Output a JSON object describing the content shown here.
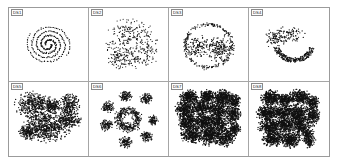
{
  "figure": {
    "title": "",
    "layout": {
      "rows": 2,
      "cols": 4
    },
    "point_color": "#111111",
    "panel_background": "#ffffff",
    "border_color": "#9b9b9b"
  },
  "panels": [
    {
      "label": "DS1",
      "description": "two-arm spiral",
      "shape": "spiral",
      "clusters": 2,
      "density": "thin-line"
    },
    {
      "label": "DS2",
      "description": "sparse crescent and blob clusters",
      "shape": "crescents",
      "clusters": 4,
      "density": "sparse"
    },
    {
      "label": "DS3",
      "description": "outer ring enclosing two dense blobs",
      "shape": "ring-with-cores",
      "clusters": 3,
      "density": "medium"
    },
    {
      "label": "DS4",
      "description": "thick lower arc with scattered upper clusters",
      "shape": "arc",
      "clusters": 3,
      "density": "medium"
    },
    {
      "label": "DS5",
      "description": "blobs of varying size including a dumbbell",
      "shape": "blobs",
      "clusters": 6,
      "density": "dense"
    },
    {
      "label": "DS6",
      "description": "central annulus cluster with satellite blobs",
      "shape": "annulus-satellites",
      "clusters": 8,
      "density": "dense"
    },
    {
      "label": "DS7",
      "description": "many overlapping irregular dense clusters",
      "shape": "irregular",
      "clusters": 15,
      "density": "very-dense"
    },
    {
      "label": "DS8",
      "description": "many overlapping irregular clusters with a tail",
      "shape": "irregular",
      "clusters": 14,
      "density": "very-dense"
    }
  ],
  "chart_data": {
    "type": "scatter",
    "title": "",
    "xlabel": "",
    "ylabel": "",
    "grid": false,
    "legend": false,
    "axis_ticks": false,
    "panels": [
      {
        "name": "DS1",
        "generator": "spiral",
        "params": {
          "arms": 2,
          "turns": 2.1,
          "points_per_arm": 150,
          "noise": 0.6,
          "r_max": 30
        },
        "xlim": [
          0,
          100
        ],
        "ylim": [
          0,
          100
        ]
      },
      {
        "name": "DS2",
        "generator": "gaussian_clusters",
        "params": {
          "noise": 3.2,
          "marker_size": 0.75
        },
        "clusters": [
          {
            "cx": 52,
            "cy": 34,
            "rx": 17,
            "ry": 15,
            "n": 180
          },
          {
            "cx": 30,
            "cy": 62,
            "rx": 9,
            "ry": 14,
            "n": 70
          },
          {
            "cx": 50,
            "cy": 74,
            "rx": 16,
            "ry": 9,
            "n": 120
          },
          {
            "cx": 80,
            "cy": 56,
            "rx": 8,
            "ry": 16,
            "n": 80
          }
        ],
        "xlim": [
          0,
          100
        ],
        "ylim": [
          0,
          100
        ]
      },
      {
        "name": "DS3",
        "generator": "ring_plus_blobs",
        "params": {
          "ring_cx": 50,
          "ring_cy": 52,
          "ring_r": 36,
          "ring_n": 220,
          "ring_noise": 1.6
        },
        "clusters": [
          {
            "cx": 34,
            "cy": 54,
            "rx": 11,
            "ry": 10,
            "n": 130
          },
          {
            "cx": 66,
            "cy": 56,
            "rx": 12,
            "ry": 12,
            "n": 190
          }
        ],
        "xlim": [
          0,
          100
        ],
        "ylim": [
          0,
          100
        ]
      },
      {
        "name": "DS4",
        "generator": "arc_plus_blobs",
        "params": {
          "arc_cx": 58,
          "arc_cy": 48,
          "arc_r": 28,
          "arc_start_deg": 15,
          "arc_end_deg": 165,
          "arc_n": 260,
          "arc_thickness": 4
        },
        "clusters": [
          {
            "cx": 30,
            "cy": 40,
            "rx": 8,
            "ry": 9,
            "n": 90
          },
          {
            "cx": 50,
            "cy": 33,
            "rx": 12,
            "ry": 7,
            "n": 90
          }
        ],
        "xlim": [
          0,
          100
        ],
        "ylim": [
          0,
          100
        ]
      },
      {
        "name": "DS5",
        "generator": "gaussian_clusters",
        "params": {
          "noise": 1.1,
          "marker_size": 0.85
        },
        "clusters": [
          {
            "cx": 28,
            "cy": 28,
            "rx": 15,
            "ry": 12,
            "n": 420
          },
          {
            "cx": 57,
            "cy": 28,
            "rx": 7,
            "ry": 6,
            "n": 150
          },
          {
            "cx": 82,
            "cy": 26,
            "rx": 8,
            "ry": 10,
            "n": 220
          },
          {
            "cx": 82,
            "cy": 52,
            "rx": 9,
            "ry": 9,
            "n": 230
          },
          {
            "cx": 47,
            "cy": 62,
            "rx": 19,
            "ry": 13,
            "n": 620
          },
          {
            "cx": 18,
            "cy": 72,
            "rx": 7,
            "ry": 6,
            "n": 150
          }
        ],
        "xlim": [
          0,
          100
        ],
        "ylim": [
          0,
          100
        ]
      },
      {
        "name": "DS6",
        "generator": "annulus_plus_satellites",
        "params": {
          "ring_cx": 50,
          "ring_cy": 50,
          "ring_r": 15,
          "ring_n": 420,
          "ring_noise": 3.2
        },
        "clusters": [
          {
            "cx": 45,
            "cy": 13,
            "rx": 5,
            "ry": 5,
            "n": 110
          },
          {
            "cx": 78,
            "cy": 16,
            "rx": 5,
            "ry": 5,
            "n": 110
          },
          {
            "cx": 18,
            "cy": 30,
            "rx": 5,
            "ry": 5,
            "n": 110
          },
          {
            "cx": 88,
            "cy": 52,
            "rx": 4,
            "ry": 4,
            "n": 90
          },
          {
            "cx": 16,
            "cy": 60,
            "rx": 5,
            "ry": 5,
            "n": 110
          },
          {
            "cx": 78,
            "cy": 78,
            "rx": 5,
            "ry": 5,
            "n": 110
          },
          {
            "cx": 45,
            "cy": 88,
            "rx": 5,
            "ry": 5,
            "n": 110
          }
        ],
        "xlim": [
          0,
          100
        ],
        "ylim": [
          0,
          100
        ]
      },
      {
        "name": "DS7",
        "generator": "gaussian_clusters",
        "params": {
          "noise": 1.4,
          "marker_size": 0.9
        },
        "clusters": [
          {
            "cx": 20,
            "cy": 14,
            "rx": 7,
            "ry": 6,
            "n": 260
          },
          {
            "cx": 48,
            "cy": 12,
            "rx": 6,
            "ry": 5,
            "n": 220
          },
          {
            "cx": 72,
            "cy": 14,
            "rx": 8,
            "ry": 6,
            "n": 280
          },
          {
            "cx": 90,
            "cy": 20,
            "rx": 5,
            "ry": 6,
            "n": 160
          },
          {
            "cx": 14,
            "cy": 34,
            "rx": 8,
            "ry": 8,
            "n": 300
          },
          {
            "cx": 40,
            "cy": 30,
            "rx": 9,
            "ry": 7,
            "n": 320
          },
          {
            "cx": 66,
            "cy": 34,
            "rx": 9,
            "ry": 9,
            "n": 340
          },
          {
            "cx": 88,
            "cy": 42,
            "rx": 6,
            "ry": 8,
            "n": 220
          },
          {
            "cx": 18,
            "cy": 55,
            "rx": 8,
            "ry": 8,
            "n": 300
          },
          {
            "cx": 42,
            "cy": 54,
            "rx": 8,
            "ry": 7,
            "n": 300
          },
          {
            "cx": 64,
            "cy": 58,
            "rx": 9,
            "ry": 9,
            "n": 340
          },
          {
            "cx": 24,
            "cy": 76,
            "rx": 9,
            "ry": 7,
            "n": 300
          },
          {
            "cx": 50,
            "cy": 78,
            "rx": 8,
            "ry": 8,
            "n": 300
          },
          {
            "cx": 74,
            "cy": 80,
            "rx": 9,
            "ry": 8,
            "n": 320
          },
          {
            "cx": 90,
            "cy": 66,
            "rx": 5,
            "ry": 6,
            "n": 150
          }
        ],
        "xlim": [
          0,
          100
        ],
        "ylim": [
          0,
          100
        ]
      },
      {
        "name": "DS8",
        "generator": "gaussian_clusters",
        "params": {
          "noise": 1.4,
          "marker_size": 0.9
        },
        "clusters": [
          {
            "cx": 22,
            "cy": 16,
            "rx": 8,
            "ry": 7,
            "n": 300
          },
          {
            "cx": 44,
            "cy": 18,
            "rx": 6,
            "ry": 5,
            "n": 200
          },
          {
            "cx": 66,
            "cy": 14,
            "rx": 8,
            "ry": 7,
            "n": 300
          },
          {
            "cx": 86,
            "cy": 22,
            "rx": 5,
            "ry": 5,
            "n": 150
          },
          {
            "cx": 16,
            "cy": 40,
            "rx": 8,
            "ry": 7,
            "n": 300
          },
          {
            "cx": 40,
            "cy": 38,
            "rx": 10,
            "ry": 6,
            "n": 300
          },
          {
            "cx": 64,
            "cy": 42,
            "rx": 9,
            "ry": 9,
            "n": 340
          },
          {
            "cx": 86,
            "cy": 44,
            "rx": 6,
            "ry": 9,
            "n": 230
          },
          {
            "cx": 20,
            "cy": 62,
            "rx": 9,
            "ry": 7,
            "n": 300
          },
          {
            "cx": 44,
            "cy": 60,
            "rx": 8,
            "ry": 8,
            "n": 300
          },
          {
            "cx": 68,
            "cy": 62,
            "rx": 7,
            "ry": 8,
            "n": 280
          },
          {
            "cx": 26,
            "cy": 82,
            "rx": 9,
            "ry": 7,
            "n": 300
          },
          {
            "cx": 52,
            "cy": 84,
            "rx": 8,
            "ry": 7,
            "n": 280
          },
          {
            "cx": 80,
            "cy": 80,
            "rx": 5,
            "ry": 9,
            "n": 200
          }
        ],
        "xlim": [
          0,
          100
        ],
        "ylim": [
          0,
          100
        ]
      }
    ]
  }
}
